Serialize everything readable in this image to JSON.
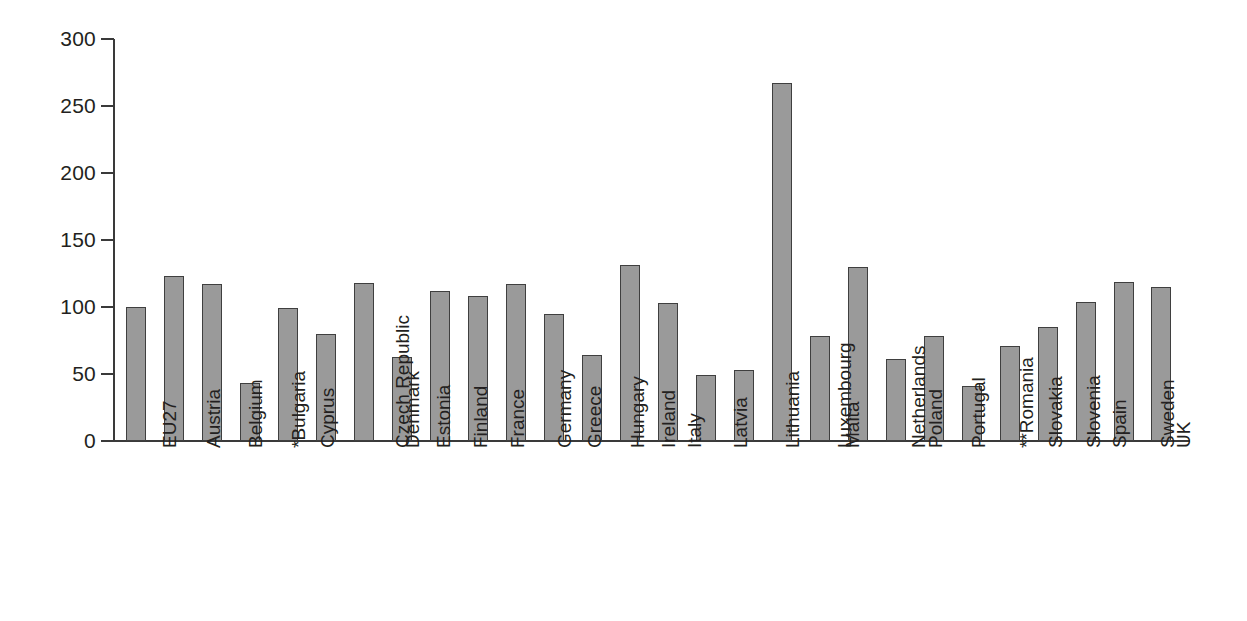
{
  "chart_data": {
    "type": "bar",
    "title": "",
    "subtitle": "",
    "xlabel": "",
    "ylabel": "",
    "ylim": [
      0,
      300
    ],
    "yticks": [
      0,
      50,
      100,
      150,
      200,
      250,
      300
    ],
    "grid": false,
    "legend": "none",
    "bar_color": "#9a9a9a",
    "bar_border_color": "#3f3f3f",
    "axis_color": "#3a3a3a",
    "categories": [
      "EU27",
      "Austria",
      "Belgium",
      "*Bulgaria",
      "Cyprus",
      "Czech Republic",
      "Denmark",
      "Estonia",
      "Finland",
      "France",
      "Germany",
      "Greece",
      "Hungary",
      "Ireland",
      "Italy",
      "Latvia",
      "Lithuania",
      "Luxembourg",
      "Malta",
      "Netherlands",
      "Poland",
      "Portugal",
      "**Romania",
      "Slovakia",
      "Slovenia",
      "Spain",
      "Sweden",
      "UK"
    ],
    "values": [
      100,
      123,
      117,
      43,
      99,
      80,
      118,
      63,
      112,
      108,
      117,
      95,
      64,
      131,
      103,
      49,
      53,
      267,
      78,
      130,
      61,
      78,
      41,
      71,
      85,
      104,
      119,
      115
    ]
  }
}
